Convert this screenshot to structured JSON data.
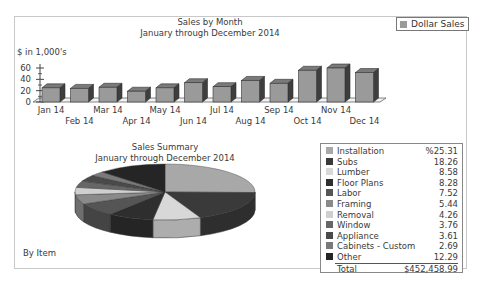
{
  "bar_chart": {
    "title": "Sales by Month",
    "subtitle": "January through December 2014",
    "ylabel": "$ in 1,000's",
    "yticks": [
      "60",
      "40",
      "20",
      "0"
    ],
    "legend_label": "Dollar Sales"
  },
  "pie_chart": {
    "title": "Sales Summary",
    "subtitle": "January through December 2014",
    "footer": "By Item"
  },
  "summary_table": {
    "rows": [
      {
        "label": "Installation",
        "value": "%25.31",
        "color": "#a8a8a8"
      },
      {
        "label": "Subs",
        "value": "18.26",
        "color": "#3a3a3a"
      },
      {
        "label": "Lumber",
        "value": "8.58",
        "color": "#d8d8d8"
      },
      {
        "label": "Floor Plans",
        "value": "8.28",
        "color": "#2e2e2e"
      },
      {
        "label": "Labor",
        "value": "7.52",
        "color": "#555555"
      },
      {
        "label": "Framing",
        "value": "5.44",
        "color": "#8a8a8a"
      },
      {
        "label": "Removal",
        "value": "4.26",
        "color": "#cfcfcf"
      },
      {
        "label": "Window",
        "value": "3.76",
        "color": "#666666"
      },
      {
        "label": "Appliance",
        "value": "3.61",
        "color": "#4a4a4a"
      },
      {
        "label": "Cabinets - Custom",
        "value": "2.69",
        "color": "#7a7a7a"
      },
      {
        "label": "Other",
        "value": "12.29",
        "color": "#252525"
      }
    ],
    "total_label": "Total",
    "total_value": "$452,458.99"
  },
  "chart_data": [
    {
      "type": "bar",
      "title": "Sales by Month",
      "subtitle": "January through December 2014",
      "xlabel": "",
      "ylabel": "$ in 1,000's",
      "ylim": [
        0,
        60
      ],
      "yticks": [
        0,
        20,
        40,
        60
      ],
      "categories": [
        "Jan 14",
        "Feb 14",
        "Mar 14",
        "Apr 14",
        "May 14",
        "Jun 14",
        "Jul 14",
        "Aug 14",
        "Sep 14",
        "Oct 14",
        "Nov 14",
        "Dec 14"
      ],
      "series": [
        {
          "name": "Dollar Sales",
          "values": [
            25,
            24,
            26,
            19,
            25,
            34,
            27,
            38,
            33,
            56,
            60,
            52
          ]
        }
      ],
      "legend_position": "top-right",
      "style": "3d"
    },
    {
      "type": "pie",
      "title": "Sales Summary",
      "subtitle": "January through December 2014",
      "footer": "By Item",
      "categories": [
        "Installation",
        "Subs",
        "Lumber",
        "Floor Plans",
        "Labor",
        "Framing",
        "Removal",
        "Window",
        "Appliance",
        "Cabinets - Custom",
        "Other"
      ],
      "values": [
        25.31,
        18.26,
        8.58,
        8.28,
        7.52,
        5.44,
        4.26,
        3.76,
        3.61,
        2.69,
        12.29
      ],
      "unit": "%",
      "total": "$452,458.99",
      "style": "3d"
    }
  ]
}
